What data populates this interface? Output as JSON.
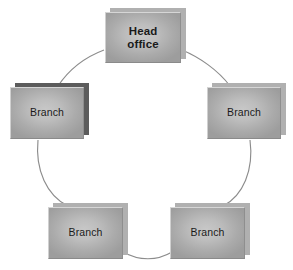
{
  "diagram": {
    "type": "ring-network-diagram",
    "background_color": "#ffffff",
    "node_fill_color": "#bdbdbd",
    "node_shadow_color": "#b0b0b0",
    "node_shadow_color_dark": "#5c5c5c",
    "edge_color": "#8c8c8c",
    "text_color": "#1a1a1a",
    "nodes": [
      {
        "id": "head-office",
        "label": "Head\noffice",
        "role": "head-office",
        "bold": true,
        "position": "top",
        "x": 105,
        "y": 12,
        "width": 76,
        "height": 51,
        "shadow_style": "soft"
      },
      {
        "id": "branch-right",
        "label": "Branch",
        "role": "branch",
        "bold": false,
        "position": "right",
        "x": 207,
        "y": 87,
        "width": 74,
        "height": 52,
        "shadow_style": "soft"
      },
      {
        "id": "branch-left",
        "label": "Branch",
        "role": "branch",
        "bold": false,
        "position": "left",
        "x": 10,
        "y": 87,
        "width": 74,
        "height": 52,
        "shadow_style": "dark"
      },
      {
        "id": "branch-bottom-right",
        "label": "Branch",
        "role": "branch",
        "bold": false,
        "position": "bottom-right",
        "x": 170,
        "y": 207,
        "width": 75,
        "height": 52,
        "shadow_style": "soft"
      },
      {
        "id": "branch-bottom-left",
        "label": "Branch",
        "role": "branch",
        "bold": false,
        "position": "bottom-left",
        "x": 48,
        "y": 207,
        "width": 75,
        "height": 52,
        "shadow_style": "soft"
      }
    ],
    "edges": [
      {
        "id": "edge-head-to-branch-left",
        "from": "head-office",
        "to": "branch-left",
        "shape": "arc"
      },
      {
        "id": "edge-head-to-branch-right",
        "from": "head-office",
        "to": "branch-right",
        "shape": "arc"
      },
      {
        "id": "edge-branch-left-to-bottom-left",
        "from": "branch-left",
        "to": "branch-bottom-left",
        "shape": "arc"
      },
      {
        "id": "edge-branch-right-to-bottom-right",
        "from": "branch-right",
        "to": "branch-bottom-right",
        "shape": "arc"
      },
      {
        "id": "edge-bottom-left-to-bottom-right",
        "from": "branch-bottom-left",
        "to": "branch-bottom-right",
        "shape": "arc"
      }
    ]
  }
}
